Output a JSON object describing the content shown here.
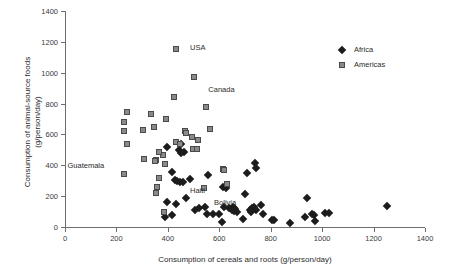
{
  "chart_data": {
    "type": "scatter",
    "title": "",
    "xlabel": "Consumption of cereals and roots (g/person/day)",
    "ylabel_line1": "Consumption of animal-source foods",
    "ylabel_line2": "(g/person/day)",
    "xlim": [
      0,
      1400
    ],
    "ylim": [
      0,
      1400
    ],
    "xticks": [
      0,
      200,
      400,
      600,
      800,
      1000,
      1200,
      1400
    ],
    "yticks": [
      0,
      200,
      400,
      600,
      800,
      1000,
      1200,
      1400
    ],
    "xtick_labels": [
      "0",
      "200",
      "400",
      "600",
      "800",
      "1000",
      "1200",
      "1400"
    ],
    "ytick_labels": [
      "0",
      "200",
      "400",
      "600",
      "800",
      "1000",
      "1200",
      "1400"
    ],
    "grid": false,
    "legend_position": "top-right",
    "colors": {
      "africa_marker": "#1c1c1c",
      "americas_fill": "#8a8a8a",
      "americas_edge": "#4a4a4a",
      "axis": "#6e6e6e",
      "text": "#2b2b2b",
      "background": "#ffffff"
    },
    "series": [
      {
        "name": "Africa",
        "marker": "diamond",
        "points": [
          [
            397,
            520
          ],
          [
            450,
            540
          ],
          [
            443,
            497
          ],
          [
            452,
            478
          ],
          [
            462,
            487
          ],
          [
            416,
            358
          ],
          [
            428,
            305
          ],
          [
            437,
            300
          ],
          [
            446,
            291
          ],
          [
            458,
            289
          ],
          [
            556,
            338
          ],
          [
            488,
            312
          ],
          [
            398,
            165
          ],
          [
            432,
            152
          ],
          [
            470,
            190
          ],
          [
            506,
            110
          ],
          [
            523,
            122
          ],
          [
            546,
            128
          ],
          [
            554,
            86
          ],
          [
            576,
            84
          ],
          [
            600,
            84
          ],
          [
            612,
            33
          ],
          [
            614,
            258
          ],
          [
            626,
            253
          ],
          [
            638,
            120
          ],
          [
            648,
            112
          ],
          [
            655,
            128
          ],
          [
            658,
            122
          ],
          [
            663,
            118
          ],
          [
            668,
            96
          ],
          [
            692,
            53
          ],
          [
            700,
            216
          ],
          [
            708,
            352
          ],
          [
            718,
            112
          ],
          [
            728,
            120
          ],
          [
            735,
            128
          ],
          [
            738,
            418
          ],
          [
            742,
            382
          ],
          [
            744,
            110
          ],
          [
            762,
            142
          ],
          [
            770,
            86
          ],
          [
            806,
            48
          ],
          [
            812,
            44
          ],
          [
            876,
            28
          ],
          [
            934,
            62
          ],
          [
            940,
            186
          ],
          [
            962,
            86
          ],
          [
            968,
            78
          ],
          [
            972,
            42
          ],
          [
            1012,
            92
          ],
          [
            1026,
            90
          ],
          [
            1254,
            134
          ],
          [
            388,
            62
          ],
          [
            415,
            80
          ],
          [
            620,
            132
          ],
          [
            658,
            104
          ],
          [
            722,
            100
          ]
        ]
      },
      {
        "name": "Americas",
        "marker": "square",
        "points": [
          [
            432,
            1152
          ],
          [
            503,
            972
          ],
          [
            425,
            843
          ],
          [
            548,
            779
          ],
          [
            240,
            748
          ],
          [
            334,
            730
          ],
          [
            230,
            680
          ],
          [
            392,
            698
          ],
          [
            228,
            620
          ],
          [
            304,
            630
          ],
          [
            345,
            648
          ],
          [
            565,
            632
          ],
          [
            466,
            625
          ],
          [
            470,
            608
          ],
          [
            492,
            585
          ],
          [
            240,
            538
          ],
          [
            519,
            565
          ],
          [
            430,
            551
          ],
          [
            448,
            540
          ],
          [
            498,
            506
          ],
          [
            512,
            505
          ],
          [
            380,
            466
          ],
          [
            364,
            483
          ],
          [
            308,
            443
          ],
          [
            352,
            433
          ],
          [
            350,
            428
          ],
          [
            390,
            408
          ],
          [
            228,
            345
          ],
          [
            616,
            375
          ],
          [
            620,
            368
          ],
          [
            631,
            280
          ],
          [
            366,
            315
          ],
          [
            541,
            254
          ],
          [
            357,
            257
          ],
          [
            352,
            222
          ],
          [
            385,
            95
          ]
        ]
      }
    ],
    "annotations": [
      {
        "label": "USA",
        "x": 432,
        "y": 1152,
        "dx": 14,
        "dy": -2
      },
      {
        "label": "Canada",
        "x": 503,
        "y": 972,
        "dx": 14,
        "dy": 12
      },
      {
        "label": "Bolivia",
        "x": 541,
        "y": 254,
        "dx": 10,
        "dy": 14
      },
      {
        "label": "Guatemala",
        "x": 352,
        "y": 222,
        "dx": -88,
        "dy": -28
      },
      {
        "label": "Haiti",
        "x": 385,
        "y": 95,
        "dx": 26,
        "dy": -22
      }
    ]
  },
  "legend": {
    "items": [
      {
        "label": "Africa",
        "marker": "diamond"
      },
      {
        "label": "Americas",
        "marker": "square"
      }
    ]
  }
}
